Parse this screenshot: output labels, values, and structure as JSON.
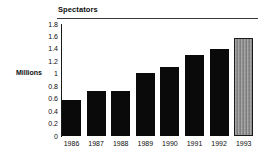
{
  "chart_data": {
    "type": "bar",
    "title": "Spectators",
    "xlabel": "",
    "ylabel": "Millions",
    "ylim": [
      0,
      1.8
    ],
    "grid": false,
    "legend": "none",
    "categories": [
      "1986",
      "1987",
      "1988",
      "1989",
      "1990",
      "1991",
      "1992",
      "1993"
    ],
    "values": [
      0.58,
      0.72,
      0.73,
      1.01,
      1.11,
      1.31,
      1.4,
      1.58
    ],
    "ytick_labels": [
      "1.8",
      "1.6",
      "1.4",
      "1.2",
      "1",
      "0.8",
      "0.6",
      "0.4",
      "0.2",
      "0"
    ],
    "ytick_values": [
      1.8,
      1.6,
      1.4,
      1.2,
      1.0,
      0.8,
      0.6,
      0.4,
      0.2,
      0.0
    ],
    "series": [
      {
        "name": "Spectators",
        "values": [
          0.58,
          0.72,
          0.73,
          1.01,
          1.11,
          1.31,
          1.4,
          1.58
        ]
      }
    ],
    "bar_styles": [
      "solid",
      "solid",
      "solid",
      "solid",
      "solid",
      "solid",
      "solid",
      "textured"
    ],
    "colors": {
      "bar_fill": "#0a0a0a",
      "highlight_bar_fill": "#8a8a8a",
      "axis": "#1a1a1a",
      "rule": "#3a3a3a",
      "text": "#0d0d0d",
      "background": "#ffffff"
    }
  }
}
